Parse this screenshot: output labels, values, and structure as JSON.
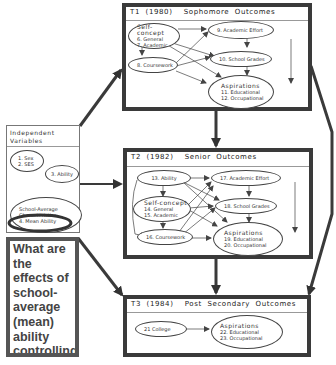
{
  "independent_variables": {
    "title_line1": "Independent",
    "title_line2": "Variables",
    "node_sex_ses": {
      "line1": "1. Sex",
      "line2": "2. SES"
    },
    "node_ability": {
      "label": "3. Ability"
    },
    "node_school_avg": {
      "line1": "School-Average",
      "line2": "Characteristics",
      "line3": "4. Mean Ability"
    }
  },
  "question": {
    "text": "What are the effects of school-average (mean) ability controlling background variables"
  },
  "t1": {
    "title": "T1  (1980)    Sophomore  Outcomes",
    "self_concept": {
      "head": "Self-concept",
      "line1": "6. General",
      "line2": "7. Academic"
    },
    "coursework": {
      "label": "8. Coursework"
    },
    "academic_effort": {
      "label": "9. Academic Effort"
    },
    "school_grades": {
      "label": "10. School Grades"
    },
    "aspirations": {
      "head": "Aspirations",
      "line1": "11. Educational",
      "line2": "12. Occupational"
    }
  },
  "t2": {
    "title": "T2  (1982)    Senior  Outcomes",
    "ability": {
      "label": "13. Ability"
    },
    "self_concept": {
      "head": "Self-concept",
      "line1": "14. General",
      "line2": "15. Academic"
    },
    "coursework": {
      "label": "16. Coursework"
    },
    "academic_effort": {
      "label": "17. Academic Effort"
    },
    "school_grades": {
      "label": "18. School Grades"
    },
    "aspirations": {
      "head": "Aspirations",
      "line1": "19. Educational",
      "line2": "20. Occupational"
    }
  },
  "t3": {
    "title": "T3  (1984)    Post  Secondary  Outcomes",
    "college": {
      "label": "21 College"
    },
    "aspirations": {
      "head": "Aspirations",
      "line1": "22. Educational",
      "line2": "23. Occupational"
    }
  },
  "colors": {
    "border": "#3a3a3a",
    "line": "#444444",
    "highlight": "#333333"
  }
}
